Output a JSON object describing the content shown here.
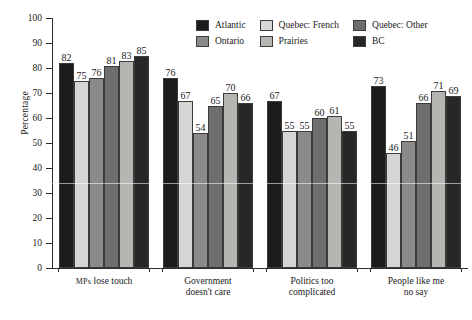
{
  "chart_data": {
    "type": "bar",
    "title": "",
    "subtitle": "",
    "xlabel": "",
    "ylabel": "Percentage",
    "ylim": [
      0,
      100
    ],
    "ytick_step": 10,
    "yticks": [
      0,
      10,
      20,
      30,
      40,
      50,
      60,
      70,
      80,
      90,
      100
    ],
    "grid": false,
    "legend_position": "top-center",
    "legend_layout": "2 rows x 3 columns",
    "value_labels": true,
    "categories": [
      "MPs lose touch",
      "Government doesn't care",
      "Politics too complicated",
      "People like me no say"
    ],
    "category_lines": [
      [
        "MPs",
        "lose touch"
      ],
      [
        "Government",
        "doesn't care"
      ],
      [
        "Politics too",
        "complicated"
      ],
      [
        "People like me",
        "no say"
      ]
    ],
    "series": [
      {
        "name": "Atlantic",
        "color": "#1c1c1c",
        "values": [
          82,
          76,
          67,
          73
        ]
      },
      {
        "name": "Quebec: French",
        "color": "#d5d5d3",
        "values": [
          75,
          67,
          55,
          46
        ]
      },
      {
        "name": "Ontario",
        "color": "#8a8a88",
        "values": [
          76,
          54,
          55,
          51
        ]
      },
      {
        "name": "Quebec: Other",
        "color": "#6e6e6c",
        "values": [
          81,
          65,
          60,
          66
        ]
      },
      {
        "name": "Prairies",
        "color": "#b5b5b2",
        "values": [
          83,
          70,
          61,
          71
        ]
      },
      {
        "name": "BC",
        "color": "#272727",
        "values": [
          85,
          66,
          55,
          69
        ]
      }
    ],
    "legend_order": [
      "Atlantic",
      "Ontario",
      "Quebec: French",
      "Prairies",
      "Quebec: Other",
      "BC"
    ]
  }
}
